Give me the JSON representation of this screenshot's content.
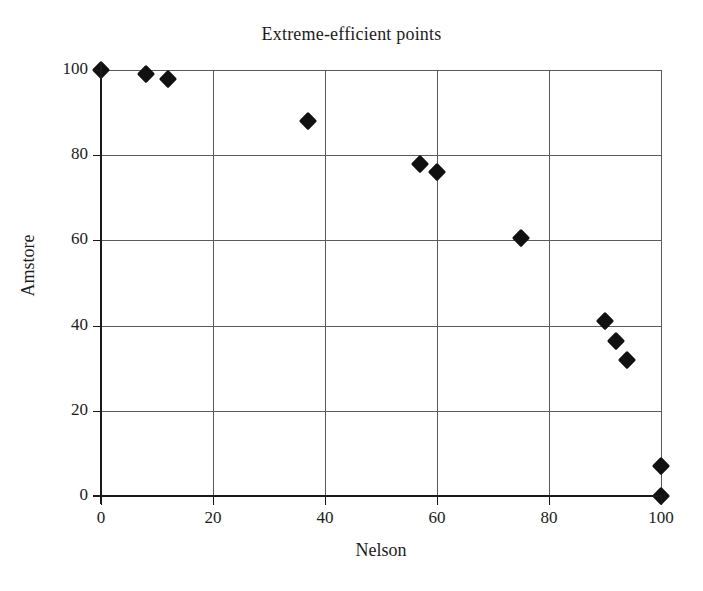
{
  "chart_data": {
    "type": "scatter",
    "title": "Extreme-efficient points",
    "xlabel": "Nelson",
    "ylabel": "Amstore",
    "xlim": [
      0,
      100
    ],
    "ylim": [
      0,
      100
    ],
    "xticks": [
      0,
      20,
      40,
      60,
      80,
      100
    ],
    "yticks": [
      0,
      20,
      40,
      60,
      80,
      100
    ],
    "xtick_labels": [
      "0",
      "20",
      "40",
      "60",
      "80",
      "100"
    ],
    "ytick_labels": [
      "0",
      "20",
      "40",
      "60",
      "80",
      "100"
    ],
    "grid": true,
    "legend": null,
    "marker": "diamond",
    "marker_color": "#111111",
    "grid_color": "#5a5a5a",
    "axis_color": "#1a1a1a",
    "background": "#ffffff",
    "series": [
      {
        "name": "Extreme-efficient points",
        "points": [
          {
            "x": 0,
            "y": 100
          },
          {
            "x": 8,
            "y": 99
          },
          {
            "x": 12,
            "y": 98
          },
          {
            "x": 37,
            "y": 88
          },
          {
            "x": 57,
            "y": 78
          },
          {
            "x": 60,
            "y": 76
          },
          {
            "x": 75,
            "y": 60.5
          },
          {
            "x": 90,
            "y": 41
          },
          {
            "x": 92,
            "y": 36.5
          },
          {
            "x": 94,
            "y": 32
          },
          {
            "x": 100,
            "y": 7
          },
          {
            "x": 100,
            "y": 0
          }
        ]
      }
    ]
  }
}
